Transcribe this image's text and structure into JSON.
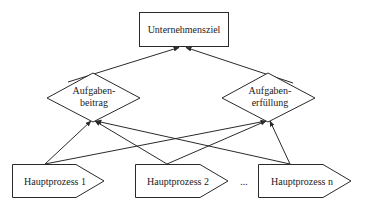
{
  "diagram": {
    "goal": {
      "label": "Unternehmensziel"
    },
    "criteria": [
      {
        "label_line1": "Aufgaben-",
        "label_line2": "beitrag"
      },
      {
        "label_line1": "Aufgaben-",
        "label_line2": "erfüllung"
      }
    ],
    "processes": [
      {
        "label": "Hauptprozess 1"
      },
      {
        "label": "Hauptprozess 2"
      },
      {
        "label": "Hauptprozess n"
      }
    ],
    "ellipsis": "...",
    "colors": {
      "stroke": "#2a2a2a",
      "fill": "#ffffff",
      "text": "#222222"
    }
  }
}
